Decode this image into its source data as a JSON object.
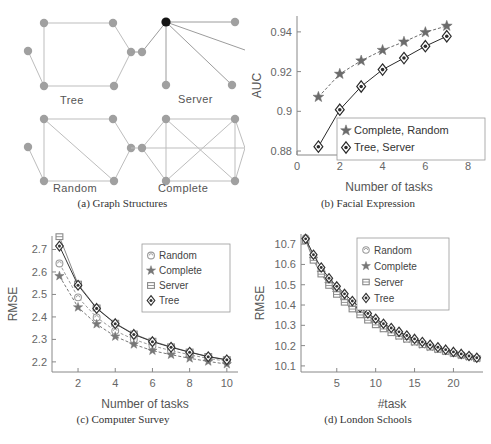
{
  "figure": {
    "panels": [
      {
        "id": "a",
        "caption": "(a) Graph Structures"
      },
      {
        "id": "b",
        "caption": "(b) Facial Expression"
      },
      {
        "id": "c",
        "caption": "(c) Computer Survey"
      },
      {
        "id": "d",
        "caption": "(d) London Schools"
      }
    ]
  },
  "panel_a": {
    "caption": "(a) Graph Structures",
    "labels": {
      "tree": "Tree",
      "server": "Server",
      "random": "Random",
      "complete": "Complete"
    },
    "node_color": "#9e9e9e",
    "hub_color": "#1a1a1a",
    "edge_color": "#b0b0b0"
  },
  "chart_data": [
    {
      "panel": "b",
      "type": "line",
      "title": "(b) Facial Expression",
      "xlabel": "Number of tasks",
      "ylabel": "AUC",
      "xlim": [
        0,
        8.6
      ],
      "ylim": [
        0.878,
        0.948
      ],
      "xticks": [
        0,
        2,
        4,
        6,
        8
      ],
      "yticks": [
        0.88,
        0.9,
        0.92,
        0.94
      ],
      "ytick_labels": [
        "0.88",
        "0.9",
        "0.92",
        "0.94"
      ],
      "grid": false,
      "legend_position": "lower-right",
      "x": [
        1,
        2,
        3,
        4,
        5,
        6,
        7
      ],
      "series": [
        {
          "name": "Complete, Random",
          "marker": "star",
          "color": "#6b6b6b",
          "values": [
            0.9072,
            0.9188,
            0.9255,
            0.9308,
            0.935,
            0.9398,
            0.943
          ]
        },
        {
          "name": "Tree, Server",
          "marker": "diamond",
          "color": "#2a2a2a",
          "values": [
            0.8822,
            0.9008,
            0.9125,
            0.921,
            0.9268,
            0.9328,
            0.9378
          ]
        }
      ]
    },
    {
      "panel": "c",
      "type": "line",
      "title": "(c) Computer Survey",
      "xlabel": "Number of tasks",
      "ylabel": "RMSE",
      "xlim": [
        0.6,
        10.6
      ],
      "ylim": [
        2.155,
        2.76
      ],
      "xticks": [
        2,
        4,
        6,
        8,
        10
      ],
      "yticks": [
        2.2,
        2.3,
        2.4,
        2.5,
        2.6,
        2.7
      ],
      "ytick_labels": [
        "2.2",
        "2.3",
        "2.4",
        "2.5",
        "2.6",
        "2.7"
      ],
      "grid": false,
      "legend_position": "upper-right",
      "x": [
        1,
        2,
        3,
        4,
        5,
        6,
        7,
        8,
        9,
        10
      ],
      "series": [
        {
          "name": "Random",
          "marker": "circle",
          "color": "#9a9a9a",
          "values": [
            2.638,
            2.487,
            2.398,
            2.338,
            2.3,
            2.272,
            2.25,
            2.232,
            2.215,
            2.203
          ]
        },
        {
          "name": "Complete",
          "marker": "star",
          "color": "#777777",
          "values": [
            2.582,
            2.443,
            2.368,
            2.313,
            2.278,
            2.25,
            2.232,
            2.216,
            2.202,
            2.19
          ]
        },
        {
          "name": "Server",
          "marker": "square",
          "color": "#8a8a8a",
          "values": [
            2.757,
            2.546,
            2.44,
            2.372,
            2.324,
            2.292,
            2.267,
            2.244,
            2.224,
            2.21
          ]
        },
        {
          "name": "Tree",
          "marker": "diamond",
          "color": "#333333",
          "values": [
            2.715,
            2.541,
            2.438,
            2.37,
            2.322,
            2.29,
            2.265,
            2.243,
            2.223,
            2.209
          ]
        }
      ]
    },
    {
      "panel": "d",
      "type": "line",
      "title": "(d) London Schools",
      "xlabel": "#task",
      "ylabel": "RMSE",
      "xlim": [
        0.4,
        23.8
      ],
      "ylim": [
        10.07,
        10.75
      ],
      "xticks": [
        5,
        10,
        15,
        20
      ],
      "yticks": [
        10.1,
        10.2,
        10.3,
        10.4,
        10.5,
        10.6,
        10.7
      ],
      "ytick_labels": [
        "10.1",
        "10.2",
        "10.3",
        "10.4",
        "10.5",
        "10.6",
        "10.7"
      ],
      "grid": false,
      "legend_position": "upper-right",
      "x": [
        1,
        2,
        3,
        4,
        5,
        6,
        7,
        8,
        9,
        10,
        11,
        12,
        13,
        14,
        15,
        16,
        17,
        18,
        19,
        20,
        21,
        22,
        23
      ],
      "series": [
        {
          "name": "Random",
          "marker": "circle",
          "color": "#9a9a9a",
          "values": [
            10.73,
            10.64,
            10.575,
            10.52,
            10.478,
            10.44,
            10.405,
            10.372,
            10.345,
            10.32,
            10.298,
            10.278,
            10.26,
            10.242,
            10.226,
            10.212,
            10.198,
            10.186,
            10.175,
            10.164,
            10.155,
            10.146,
            10.138
          ]
        },
        {
          "name": "Complete",
          "marker": "star",
          "color": "#777777",
          "values": [
            10.722,
            10.628,
            10.56,
            10.504,
            10.46,
            10.42,
            10.386,
            10.356,
            10.33,
            10.306,
            10.285,
            10.266,
            10.249,
            10.233,
            10.218,
            10.205,
            10.193,
            10.182,
            10.172,
            10.162,
            10.153,
            10.145,
            10.137
          ]
        },
        {
          "name": "Server",
          "marker": "square",
          "color": "#8a8a8a",
          "values": [
            10.718,
            10.62,
            10.552,
            10.496,
            10.452,
            10.413,
            10.38,
            10.351,
            10.325,
            10.302,
            10.282,
            10.263,
            10.246,
            10.231,
            10.217,
            10.204,
            10.192,
            10.181,
            10.171,
            10.162,
            10.153,
            10.145,
            10.137
          ]
        },
        {
          "name": "Tree",
          "marker": "diamond",
          "color": "#333333",
          "values": [
            10.726,
            10.648,
            10.585,
            10.532,
            10.492,
            10.455,
            10.42,
            10.388,
            10.358,
            10.332,
            10.308,
            10.287,
            10.268,
            10.25,
            10.233,
            10.218,
            10.204,
            10.192,
            10.18,
            10.169,
            10.159,
            10.149,
            10.14
          ]
        }
      ]
    }
  ]
}
